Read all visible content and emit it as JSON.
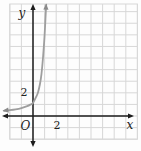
{
  "chart_data": {
    "type": "line",
    "title": "",
    "xlabel": "x",
    "ylabel": "y",
    "origin_label": "O",
    "xlim": [
      -2,
      9
    ],
    "ylim": [
      -2,
      9.66
    ],
    "grid": true,
    "legend": false,
    "x_ticks": [
      {
        "value": 2,
        "label": "2"
      }
    ],
    "y_ticks": [
      {
        "value": 2,
        "label": "2"
      }
    ],
    "series": [
      {
        "name": "exponential-curve",
        "description": "exponential growth curve passing near (0,1) and (0.43,2), asymptotic to the negative x-axis, arrowheads on both ends",
        "color": "#9e9e9e",
        "arrow_color": "#8a8a8a",
        "arrow_ends": true,
        "points": [
          [
            -2.5,
            0.45
          ],
          [
            -2.0,
            0.5
          ],
          [
            -1.5,
            0.57
          ],
          [
            -1.0,
            0.68
          ],
          [
            -0.5,
            0.85
          ],
          [
            -0.2,
            1.0
          ],
          [
            0.0,
            1.13
          ],
          [
            0.26,
            1.63
          ],
          [
            0.43,
            2.03
          ],
          [
            0.6,
            2.76
          ],
          [
            0.73,
            3.62
          ],
          [
            0.86,
            5.0
          ],
          [
            0.99,
            6.8
          ],
          [
            1.1,
            8.9
          ],
          [
            1.14,
            9.6
          ]
        ]
      }
    ],
    "colors": {
      "axis": "#1c1c1c",
      "grid": "#d7d7d7",
      "label": "#222222"
    }
  }
}
